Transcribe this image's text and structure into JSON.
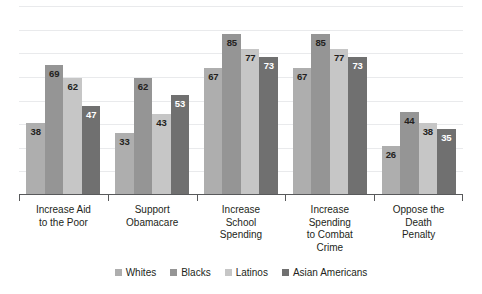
{
  "chart_data": {
    "type": "bar",
    "title": "",
    "subtitle": "",
    "xlabel": "",
    "ylabel": "",
    "ylim": [
      0,
      100
    ],
    "grid": true,
    "gridlines": [
      12.5,
      25,
      37.5,
      50,
      62.5,
      75,
      87.5,
      100
    ],
    "legend_position": "bottom",
    "orientation": "vertical",
    "grouped": true,
    "data_labels": true,
    "categories": [
      "Increase Aid\nto the Poor",
      "Support\nObamacare",
      "Increase\nSchool\nSpending",
      "Increase\nSpending\nto Combat\nCrime",
      "Oppose the\nDeath\nPenalty"
    ],
    "series": [
      {
        "name": "Whites",
        "color": "#aeaeae",
        "label_color": "#231f20",
        "values": [
          38,
          33,
          67,
          67,
          26
        ]
      },
      {
        "name": "Blacks",
        "color": "#959595",
        "label_color": "#231f20",
        "values": [
          69,
          62,
          85,
          85,
          44
        ]
      },
      {
        "name": "Latinos",
        "color": "#c6c6c6",
        "label_color": "#231f20",
        "values": [
          62,
          43,
          77,
          77,
          38
        ]
      },
      {
        "name": "Asian Americans",
        "color": "#707070",
        "label_color": "#ffffff",
        "values": [
          47,
          53,
          73,
          73,
          35
        ]
      }
    ]
  },
  "colors": {
    "background": "#ffffff",
    "gridline": "#e9eaec",
    "axis": "#58595b",
    "text": "#231f20"
  }
}
